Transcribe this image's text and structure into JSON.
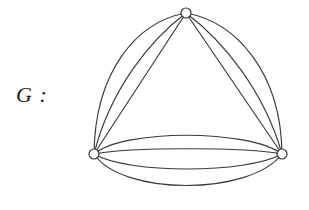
{
  "figure": {
    "label": "G :",
    "background_color": "#ffffff",
    "stroke_color": "#3a3a3a",
    "vertex_fill_color": "#ffffff"
  },
  "graph_data": {
    "type": "multigraph",
    "title": "G",
    "vertex_count": 3,
    "edge_count": 10,
    "vertex_radius": 5,
    "vertices": [
      {
        "id": "top",
        "label": "",
        "x": 186,
        "y": 13
      },
      {
        "id": "bottom-left",
        "label": "",
        "x": 94,
        "y": 154
      },
      {
        "id": "bottom-right",
        "label": "",
        "x": 282,
        "y": 154
      }
    ],
    "edge_groups": [
      {
        "name": "top-to-bottom-left",
        "source": "top",
        "target": "bottom-left",
        "multiplicity": 3,
        "paths": [
          "M 186 13 C 136 22 95 72 94 154",
          "M 186 13 C 150 40 110 90 94 154",
          "M 186 13 L 94 154"
        ]
      },
      {
        "name": "top-to-bottom-right",
        "source": "top",
        "target": "bottom-right",
        "multiplicity": 3,
        "paths": [
          "M 186 13 C 236 22 281 72 282 154",
          "M 186 13 C 222 40 264 90 282 154",
          "M 186 13 L 282 154"
        ]
      },
      {
        "name": "bottom-left-to-bottom-right",
        "source": "bottom-left",
        "target": "bottom-right",
        "multiplicity": 4,
        "paths": [
          "M 94 154 C 124 129 248 129 282 154",
          "M 94 154 C 130 147 246 147 282 154",
          "M 94 154 C 128 174 246 174 282 154",
          "M 94 154 C 122 196 250 196 282 154"
        ]
      }
    ]
  }
}
